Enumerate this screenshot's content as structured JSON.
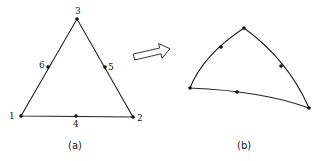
{
  "figure": {
    "panel_a": {
      "caption": "(a)",
      "description": "straight-sided 6-node triangular element",
      "nodes": [
        {
          "id": "1",
          "label": "1",
          "x": 21,
          "y": 116
        },
        {
          "id": "2",
          "label": "2",
          "x": 133,
          "y": 117
        },
        {
          "id": "3",
          "label": "3",
          "x": 77,
          "y": 19
        },
        {
          "id": "4",
          "label": "4",
          "x": 76,
          "y": 116
        },
        {
          "id": "5",
          "label": "5",
          "x": 105,
          "y": 67
        },
        {
          "id": "6",
          "label": "6",
          "x": 48,
          "y": 67
        }
      ]
    },
    "arrow": {
      "icon": "hollow-arrow-right-icon",
      "from": [
        134,
        57
      ],
      "to": [
        172,
        48
      ]
    },
    "panel_b": {
      "caption": "(b)",
      "description": "curved-sided (isoparametric) 6-node triangular element",
      "nodes": [
        {
          "id": "1",
          "x": 190,
          "y": 88
        },
        {
          "id": "2",
          "x": 309,
          "y": 108
        },
        {
          "id": "3",
          "x": 244,
          "y": 28
        },
        {
          "id": "4",
          "x": 237,
          "y": 92
        },
        {
          "id": "5",
          "x": 281,
          "y": 66
        },
        {
          "id": "6",
          "x": 221,
          "y": 47
        }
      ]
    },
    "colors": {
      "line": "#222222",
      "node": "#111111",
      "background": "#ffffff"
    }
  }
}
